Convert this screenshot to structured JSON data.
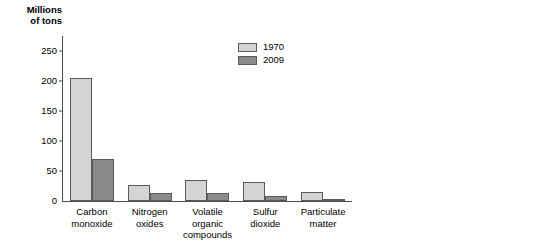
{
  "chart_data": [
    {
      "id": "criteria-pollutants",
      "type": "bar",
      "title": "",
      "ylabel": "Millions\nof tons",
      "xlabel": "",
      "ylim": [
        0,
        275
      ],
      "yticks": [
        0,
        50,
        100,
        150,
        200,
        250
      ],
      "grid": false,
      "legend_position": "upper-right",
      "categories": [
        "Carbon\nmonoxide",
        "Nitrogen\noxides",
        "Volatile\norganic\ncompounds",
        "Sulfur\ndioxide",
        "Particulate\nmatter"
      ],
      "series": [
        {
          "name": "1970",
          "color": "#d4d4d4",
          "values": [
            205,
            27,
            35,
            31,
            15
          ]
        },
        {
          "name": "2009",
          "color": "#8a8a8a",
          "values": [
            70,
            14,
            14,
            8,
            1
          ]
        }
      ]
    },
    {
      "id": "lead",
      "type": "bar",
      "title": "",
      "ylabel": "Thousands\nof tons",
      "xlabel": "",
      "ylim": [
        0,
        275
      ],
      "yticks": [
        0,
        50,
        100,
        150,
        200,
        250
      ],
      "grid": false,
      "legend_position": "upper-right",
      "categories": [
        "Lead"
      ],
      "series": [
        {
          "name": "1970",
          "color": "#d4d4d4",
          "values": [
            220
          ]
        },
        {
          "name": "2009",
          "color": "#8a8a8a",
          "values": [
            1
          ]
        }
      ]
    }
  ],
  "left_panel": {
    "axis_title": "Millions\nof tons",
    "yticks": [
      "250",
      "200",
      "150",
      "100",
      "50",
      "0"
    ],
    "categories": [
      {
        "label": "Carbon\nmonoxide"
      },
      {
        "label": "Nitrogen\noxides"
      },
      {
        "label": "Volatile\norganic\ncompounds"
      },
      {
        "label": "Sulfur\ndioxide"
      },
      {
        "label": "Particulate\nmatter"
      }
    ],
    "legend": [
      {
        "label": "1970",
        "color": "#d4d4d4"
      },
      {
        "label": "2009",
        "color": "#8a8a8a"
      }
    ]
  },
  "right_panel": {
    "axis_title": "Thousands\nof tons",
    "yticks": [
      "250",
      "200",
      "150",
      "100",
      "50",
      "0"
    ],
    "categories": [
      {
        "label": "Lead"
      }
    ],
    "legend": [
      {
        "label": "1970",
        "color": "#d4d4d4"
      },
      {
        "label": "2009",
        "color": "#8a8a8a"
      }
    ]
  }
}
